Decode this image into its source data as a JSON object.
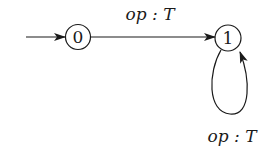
{
  "diagram": {
    "type": "state-machine",
    "states": [
      {
        "id": "0",
        "label": "0",
        "initial": true
      },
      {
        "id": "1",
        "label": "1",
        "initial": false
      }
    ],
    "transitions": [
      {
        "from": "0",
        "to": "1",
        "label": "op : T"
      },
      {
        "from": "1",
        "to": "1",
        "label": "op : T"
      }
    ],
    "colors": {
      "stroke": "#1a1a1a",
      "background": "#ffffff"
    }
  }
}
